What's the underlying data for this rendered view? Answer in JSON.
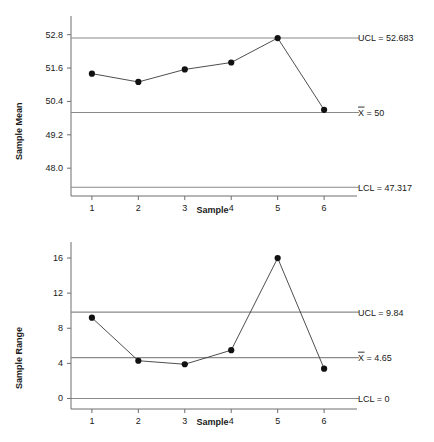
{
  "figure": {
    "kind": "control-chart-pair",
    "line_color": "#3a3a3a",
    "marker_color": "#111111",
    "limit_color": "#8a8a8a",
    "axis_color": "#6e6e6e"
  },
  "chart_data": [
    {
      "type": "line",
      "id": "xbar-chart",
      "title": "",
      "xlabel": "Sample",
      "ylabel": "Sample Mean",
      "x": [
        1,
        2,
        3,
        4,
        5,
        6
      ],
      "categories": [
        "1",
        "2",
        "3",
        "4",
        "5",
        "6"
      ],
      "values": [
        51.4,
        51.1,
        51.55,
        51.8,
        52.68,
        50.1
      ],
      "series": [
        {
          "name": "Sample Mean",
          "values": [
            51.4,
            51.1,
            51.55,
            51.8,
            52.68,
            50.1
          ]
        }
      ],
      "ytick_labels": [
        "52.8",
        "51.6",
        "50.4",
        "49.2",
        "48.0"
      ],
      "ytick_values": [
        52.8,
        51.6,
        50.4,
        49.2,
        48.0
      ],
      "xtick_labels": [
        "1",
        "2",
        "3",
        "4",
        "5",
        "6"
      ],
      "ylim": [
        47.0,
        53.4
      ],
      "xlim": [
        0.55,
        6.45
      ],
      "grid": false,
      "legend": "none",
      "control_limits": [
        {
          "name": "UCL",
          "value": 52.683,
          "label": "UCL = 52.683"
        },
        {
          "name": "CL",
          "value": 50,
          "label": "X = 50",
          "has_overbar": true,
          "symbol": "X",
          "rest": " = 50"
        },
        {
          "name": "LCL",
          "value": 47.317,
          "label": "LCL = 47.317"
        }
      ]
    },
    {
      "type": "line",
      "id": "r-chart",
      "title": "",
      "xlabel": "Sample",
      "ylabel": "Sample Range",
      "x": [
        1,
        2,
        3,
        4,
        5,
        6
      ],
      "categories": [
        "1",
        "2",
        "3",
        "4",
        "5",
        "6"
      ],
      "values": [
        9.2,
        4.3,
        3.9,
        5.5,
        16.0,
        3.4
      ],
      "series": [
        {
          "name": "Sample Range",
          "values": [
            9.2,
            4.3,
            3.9,
            5.5,
            16.0,
            3.4
          ]
        }
      ],
      "ytick_labels": [
        "16",
        "12",
        "8",
        "4",
        "0"
      ],
      "ytick_values": [
        16,
        12,
        8,
        4,
        0
      ],
      "xtick_labels": [
        "1",
        "2",
        "3",
        "4",
        "5",
        "6"
      ],
      "ylim": [
        -1.2,
        17.6
      ],
      "xlim": [
        0.55,
        6.45
      ],
      "grid": false,
      "legend": "none",
      "control_limits": [
        {
          "name": "UCL",
          "value": 9.84,
          "label": "UCL = 9.84"
        },
        {
          "name": "CL",
          "value": 4.65,
          "label": "X = 4.65",
          "has_overbar": true,
          "symbol": "X",
          "rest": " = 4.65"
        },
        {
          "name": "LCL",
          "value": 0,
          "label": "LCL = 0"
        }
      ]
    }
  ]
}
